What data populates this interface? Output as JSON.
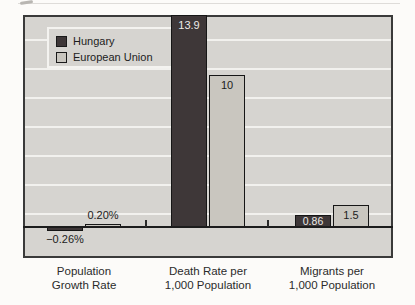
{
  "legend": {
    "items": [
      {
        "label": "Hungary",
        "color": "#3e3738"
      },
      {
        "label": "European Union",
        "color": "#c9c6bf"
      }
    ]
  },
  "chart_data": {
    "type": "bar",
    "title": "",
    "categories": [
      {
        "line1": "Population",
        "line2": "Growth Rate"
      },
      {
        "line1": "Death Rate per",
        "line2": "1,000 Population"
      },
      {
        "line1": "Migrants per",
        "line2": "1,000 Population"
      }
    ],
    "series": [
      {
        "name": "Hungary",
        "color": "#3e3738",
        "label_color": "#edebe7",
        "values": [
          -0.26,
          13.9,
          0.86
        ],
        "bars": [
          {
            "value": -0.26,
            "label": "−0.26%",
            "placement": "below"
          },
          {
            "value": 13.9,
            "label": "13.9",
            "placement": "inside"
          },
          {
            "value": 0.86,
            "label": "0.86",
            "placement": "inside"
          }
        ]
      },
      {
        "name": "European Union",
        "color": "#c9c6bf",
        "label_color": "#1c1c1c",
        "values": [
          0.2,
          10,
          1.5
        ],
        "bars": [
          {
            "value": 0.2,
            "label": "0.20%",
            "placement": "above"
          },
          {
            "value": 10,
            "label": "10",
            "placement": "inside"
          },
          {
            "value": 1.5,
            "label": "1.5",
            "placement": "inside"
          }
        ]
      }
    ],
    "ylim": [
      -2,
      14
    ],
    "grid": true,
    "gridline_step": 2,
    "legend_position": "top-left",
    "colors": {
      "plot_background": "#d6d4d0",
      "gridline": "#f2f1ee",
      "axis": "#1c1c1c",
      "outside_label": "#1c1c1c"
    }
  }
}
